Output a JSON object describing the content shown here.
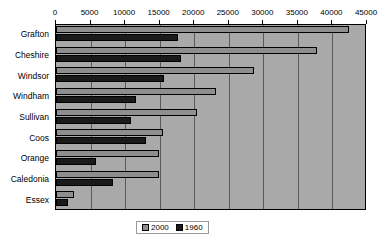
{
  "chart_data": {
    "type": "bar",
    "orientation": "horizontal",
    "title": "",
    "subtitle": "",
    "xlabel": "",
    "ylabel": "",
    "categories": [
      "Grafton",
      "Cheshire",
      "Windsor",
      "Windham",
      "Sullivan",
      "Coos",
      "Orange",
      "Caledonia",
      "Essex"
    ],
    "series": [
      {
        "name": "2000",
        "color": "#8e8e8e",
        "values": [
          42400,
          37800,
          28600,
          23150,
          20400,
          15500,
          14900,
          14900,
          2600
        ]
      },
      {
        "name": "1960",
        "color": "#1a1a1a",
        "values": [
          17700,
          18100,
          15600,
          11600,
          10850,
          13000,
          5800,
          8250,
          1750
        ]
      }
    ],
    "xlim": [
      0,
      45000
    ],
    "xticks": [
      0,
      5000,
      10000,
      15000,
      20000,
      25000,
      30000,
      35000,
      40000,
      45000
    ],
    "xtick_labels": [
      "0",
      "5000",
      "10000",
      "15000",
      "20000",
      "25000",
      "30000",
      "35000",
      "40000",
      "45000"
    ],
    "grid": true,
    "grid_axis": "x",
    "legend_position": "bottom",
    "legend_entries": [
      "2000",
      "1960"
    ],
    "plot_background": "#a9a9a9",
    "gridline_color": "#5a5a5a",
    "axis_color": "#000000"
  }
}
